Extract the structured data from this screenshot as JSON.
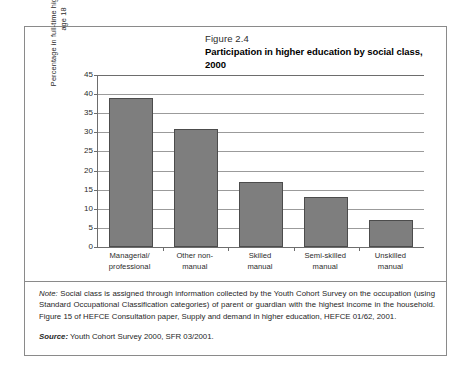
{
  "figure": {
    "number": "Figure 2.4",
    "title": "Participation in higher education by social class, 2000"
  },
  "notes": {
    "note_lead": "Note:",
    "note_body": " Social class is assigned through information collected by the Youth Cohort Survey on the occupation (using Standard Occupational Classification categories) of parent or guardian with the highest income in the household. Figure 15 of HEFCE Consultation paper, Supply and demand in higher education, HEFCE 01/62, 2001.",
    "source_lead": "Source:",
    "source_body": " Youth Cohort Survey 2000, SFR 03/2001."
  },
  "chart_data": {
    "type": "bar",
    "title": "Participation in higher education by social class, 2000",
    "xlabel": "",
    "ylabel": "Percentage in full-time higher education age 18",
    "categories": [
      "Managerial/ professional",
      "Other non- manual",
      "Skilled manual",
      "Semi-skilled manual",
      "Unskilled manual"
    ],
    "category_lines": [
      [
        "Managerial/",
        "professional"
      ],
      [
        "Other non-",
        "manual"
      ],
      [
        "Skilled",
        "manual"
      ],
      [
        "Semi-skilled",
        "manual"
      ],
      [
        "Unskilled",
        "manual"
      ]
    ],
    "values": [
      39,
      31,
      17,
      13,
      7
    ],
    "ylim": [
      0,
      45
    ],
    "yticks": [
      0,
      5,
      10,
      15,
      20,
      25,
      30,
      35,
      40,
      45
    ],
    "ytick_labels": [
      "0",
      "5",
      "10",
      "15",
      "20",
      "25",
      "30",
      "35",
      "40",
      "45"
    ],
    "grid": true,
    "legend": false,
    "bar_color": "#7e7e7e",
    "bar_edge_color": "#4c4c4c",
    "grid_color": "#9b9b9b",
    "axis_color": "#6d6d6d"
  }
}
